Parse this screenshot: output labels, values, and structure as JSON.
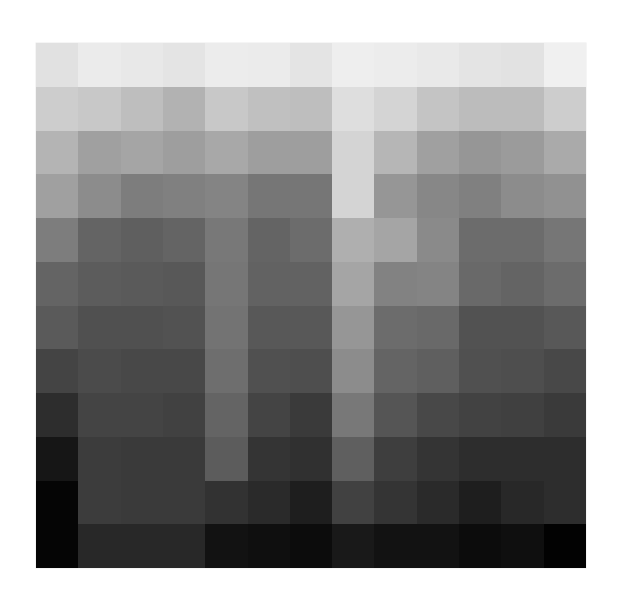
{
  "image": {
    "type": "grayscale-grid",
    "rows": 12,
    "cols": 13,
    "background": "#ffffff"
  },
  "chart_data": {
    "type": "heatmap",
    "title": "",
    "xlabel": "",
    "ylabel": "",
    "colormap": "grayscale",
    "value_range": [
      0,
      255
    ],
    "rows": 12,
    "cols": 13,
    "values": [
      [
        225,
        235,
        232,
        228,
        236,
        235,
        228,
        238,
        236,
        233,
        228,
        226,
        240
      ],
      [
        205,
        200,
        190,
        178,
        200,
        192,
        190,
        222,
        212,
        196,
        188,
        188,
        205
      ],
      [
        180,
        160,
        165,
        158,
        168,
        158,
        158,
        212,
        182,
        160,
        150,
        155,
        170
      ],
      [
        160,
        140,
        125,
        128,
        132,
        118,
        118,
        212,
        150,
        135,
        128,
        140,
        145
      ],
      [
        125,
        100,
        95,
        100,
        120,
        100,
        108,
        175,
        165,
        138,
        108,
        108,
        118
      ],
      [
        100,
        92,
        90,
        88,
        118,
        98,
        98,
        165,
        130,
        132,
        105,
        100,
        108
      ],
      [
        90,
        80,
        80,
        82,
        115,
        88,
        88,
        150,
        108,
        105,
        82,
        82,
        88
      ],
      [
        68,
        75,
        72,
        72,
        110,
        80,
        78,
        140,
        100,
        95,
        80,
        78,
        72
      ],
      [
        45,
        68,
        68,
        65,
        100,
        68,
        58,
        120,
        85,
        72,
        66,
        64,
        58
      ],
      [
        22,
        60,
        58,
        58,
        92,
        52,
        48,
        95,
        62,
        52,
        45,
        45,
        45
      ],
      [
        5,
        60,
        58,
        58,
        50,
        42,
        30,
        65,
        52,
        42,
        30,
        40,
        45
      ],
      [
        5,
        40,
        40,
        40,
        18,
        15,
        12,
        25,
        18,
        18,
        12,
        15,
        2
      ]
    ]
  }
}
